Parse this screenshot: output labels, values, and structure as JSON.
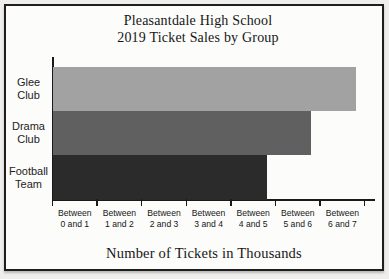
{
  "figure": {
    "title_line1": "Pleasantdale High School",
    "title_line2": "2019 Ticket Sales by Group",
    "xlabel": "Number of Tickets in Thousands"
  },
  "chart_data": {
    "type": "bar",
    "orientation": "horizontal",
    "title": "Pleasantdale High School 2019 Ticket Sales by Group",
    "xlabel": "Number of Tickets in Thousands",
    "ylabel": "",
    "categories": [
      "Glee Club",
      "Drama Club",
      "Football Team"
    ],
    "category_label_lines": [
      [
        "Glee",
        "Club"
      ],
      [
        "Drama",
        "Club"
      ],
      [
        "Football",
        "Team"
      ]
    ],
    "values_thousands": [
      6.8,
      5.8,
      4.8
    ],
    "value_bins": [
      "Between 6 and 7",
      "Between 5 and 6",
      "Between 4 and 5"
    ],
    "bar_colors": [
      "#a2a2a2",
      "#606060",
      "#2b2b2b"
    ],
    "xlim": [
      0,
      7.25
    ],
    "tick_values": [
      0,
      1,
      2,
      3,
      4,
      5,
      6,
      7
    ],
    "tick_bin_labels": [
      [
        "Between",
        "0 and 1"
      ],
      [
        "Between",
        "1 and 2"
      ],
      [
        "Between",
        "2 and 3"
      ],
      [
        "Between",
        "3 and 4"
      ],
      [
        "Between",
        "4 and 5"
      ],
      [
        "Between",
        "5 and 6"
      ],
      [
        "Between",
        "6 and 7"
      ]
    ],
    "grid": false,
    "legend": "none"
  },
  "colors": {
    "axis": "#1a1a1a",
    "frame_border": "#1e1e1e",
    "chart_background": "#fcfcfb",
    "page_background": "#efeeec"
  }
}
